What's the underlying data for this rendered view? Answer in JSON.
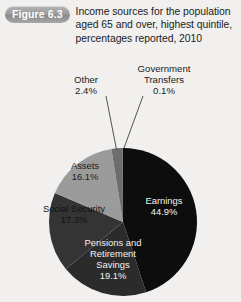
{
  "figure": {
    "badge_label": "Figure 6.3",
    "title": "Income sources for the population aged 65 and over, highest quintile, percentages reported, 2010"
  },
  "chart_data": {
    "type": "pie",
    "title": "Income sources for the population aged 65 and over, highest quintile, percentages reported, 2010",
    "unit": "percent",
    "categories": [
      "Earnings",
      "Pensions and Retirement Savings",
      "Social Security",
      "Assets",
      "Other",
      "Government Transfers"
    ],
    "values": [
      44.9,
      19.1,
      17.3,
      16.1,
      2.4,
      0.1
    ],
    "start_angle_deg": 0,
    "direction": "clockwise",
    "legend": "none (labels placed on slices)",
    "slices": [
      {
        "name": "Earnings",
        "value": 44.9,
        "label": "Earnings",
        "percent_label": "44.9%",
        "color": "#0d0d0d",
        "label_placement": "inside",
        "label_color": "#f2f2f2"
      },
      {
        "name": "Pensions and Retirement Savings",
        "value": 19.1,
        "label": "Pensions and",
        "label2": "Retirement",
        "label3": "Savings",
        "percent_label": "19.1%",
        "color": "#2b2b2b",
        "label_placement": "inside",
        "label_color": "#f2f2f2"
      },
      {
        "name": "Social Security",
        "value": 17.3,
        "label": "Social Security",
        "percent_label": "17.3%",
        "color": "#343434",
        "label_placement": "inside",
        "label_color": "#121212"
      },
      {
        "name": "Assets",
        "value": 16.1,
        "label": "Assets",
        "percent_label": "16.1%",
        "color": "#9b9b9b",
        "label_placement": "inside",
        "label_color": "#1b1b1b"
      },
      {
        "name": "Other",
        "value": 2.4,
        "label": "Other",
        "percent_label": "2.4%",
        "color": "#6d6d6d",
        "label_placement": "callout",
        "label_color": "#1b1b1b"
      },
      {
        "name": "Government Transfers",
        "value": 0.1,
        "label": "Government",
        "label2": "Transfers",
        "percent_label": "0.1%",
        "color": "#4a4a4a",
        "label_placement": "callout",
        "label_color": "#1b1b1b"
      }
    ],
    "background_color": "#f1f0ee"
  }
}
